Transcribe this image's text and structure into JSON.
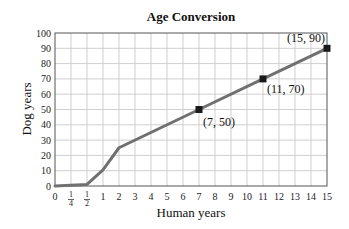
{
  "chart_data": {
    "type": "line",
    "title": "Age Conversion",
    "xlabel": "Human years",
    "ylabel": "Dog years",
    "x_ticks": [
      "0",
      "1/4",
      "1/2",
      "1",
      "2",
      "3",
      "4",
      "5",
      "6",
      "7",
      "8",
      "9",
      "10",
      "11",
      "12",
      "13",
      "14",
      "15"
    ],
    "y_ticks": [
      "0",
      "10",
      "20",
      "30",
      "40",
      "50",
      "60",
      "70",
      "80",
      "90",
      "100"
    ],
    "ylim": [
      0,
      100
    ],
    "grid": true,
    "series": [
      {
        "name": "Dog years",
        "x": [
          0,
          0.5,
          1,
          2,
          7,
          11,
          15
        ],
        "y": [
          0,
          1,
          10.5,
          25,
          50,
          70,
          90
        ]
      }
    ],
    "marked_points": [
      {
        "x": 7,
        "y": 50,
        "label": "(7, 50)"
      },
      {
        "x": 11,
        "y": 70,
        "label": "(11, 70)"
      },
      {
        "x": 15,
        "y": 90,
        "label": "(15, 90)"
      }
    ],
    "colors": {
      "line": "#707070",
      "grid": "#cfcfcf",
      "axis": "#555555",
      "marker": "#1a1a1a"
    }
  }
}
